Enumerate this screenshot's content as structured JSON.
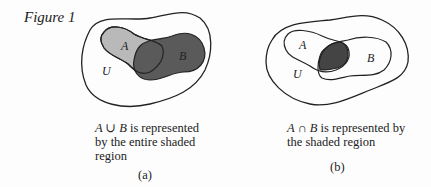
{
  "figure": {
    "title": "Figure 1"
  },
  "panels": [
    {
      "id": "a",
      "sub_label": "(a)",
      "set_labels": {
        "universe": "U",
        "a": "A",
        "b": "B"
      },
      "expression": "A ∪ B",
      "caption_rest": " is represented by the entire shaded region",
      "shading": {
        "a_only": "#b8b8b8",
        "b": "#5a5a5a",
        "overlap": "#4a4a4a"
      }
    },
    {
      "id": "b",
      "sub_label": "(b)",
      "set_labels": {
        "universe": "U",
        "a": "A",
        "b": "B"
      },
      "expression": "A ∩ B",
      "caption_rest": " is represented by the shaded region",
      "shading": {
        "overlap": "#444444"
      }
    }
  ]
}
